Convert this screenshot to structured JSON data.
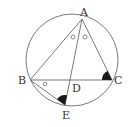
{
  "diagram": {
    "type": "geometry-circle-inscribed-triangle",
    "colors": {
      "stroke": "#6a6a6a",
      "fill_marker": "#1a1a1a",
      "label": "#333333"
    },
    "circle": {
      "cx": 72,
      "cy": 60,
      "r": 46
    },
    "points": {
      "A": {
        "label": "A",
        "x": 82,
        "y": 19
      },
      "B": {
        "label": "B",
        "x": 30,
        "y": 80
      },
      "C": {
        "label": "C",
        "x": 112,
        "y": 80
      },
      "D": {
        "label": "D",
        "x": 72,
        "y": 80
      },
      "E": {
        "label": "E",
        "x": 65,
        "y": 105
      }
    },
    "segments": [
      "AB",
      "AC",
      "BC",
      "AE",
      "BE"
    ],
    "angle_marks": [
      {
        "at": "A",
        "type": "small-circle",
        "between": "BAD"
      },
      {
        "at": "A",
        "type": "small-circle",
        "between": "DAC"
      },
      {
        "at": "B",
        "type": "small-circle",
        "between": "DBE"
      },
      {
        "at": "C",
        "type": "filled-sector",
        "between": "ACB"
      },
      {
        "at": "E",
        "type": "filled-sector",
        "between": "BEA"
      }
    ]
  }
}
